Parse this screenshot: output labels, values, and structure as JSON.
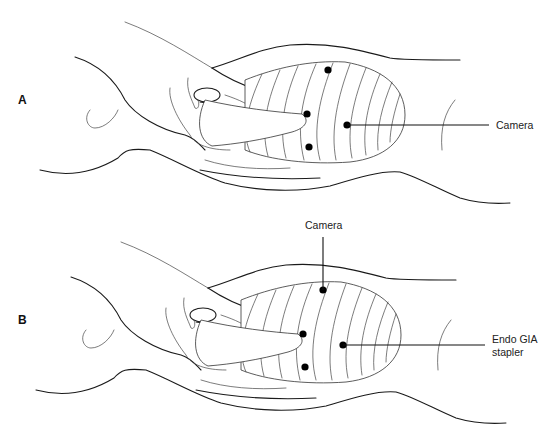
{
  "figure": {
    "panels": [
      {
        "id": "A",
        "letter": "A",
        "callouts": [
          {
            "label": "Camera",
            "target": "lower-mid-chest port"
          }
        ],
        "port_count": 4
      },
      {
        "id": "B",
        "letter": "B",
        "callouts": [
          {
            "label": "Camera",
            "target": "upper chest port"
          },
          {
            "label_line1": "Endo GIA",
            "label_line2": "stapler",
            "target": "mid chest port"
          }
        ],
        "port_count": 4
      }
    ],
    "colors": {
      "line": "#1a1a1a",
      "background": "#ffffff",
      "port": "#000000"
    }
  }
}
